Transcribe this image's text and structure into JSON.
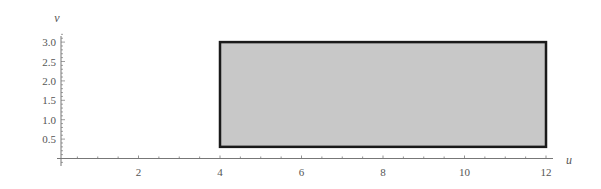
{
  "chart_data": {
    "type": "area",
    "title": "",
    "xlabel": "u",
    "ylabel": "v",
    "xlim": [
      0,
      12.5
    ],
    "ylim": [
      0,
      3.2
    ],
    "x_ticks": [
      2,
      4,
      6,
      8,
      10,
      12
    ],
    "x_tick_labels": [
      "2",
      "4",
      "6",
      "8",
      "10",
      "12"
    ],
    "y_ticks": [
      0.5,
      1.0,
      1.5,
      2.0,
      2.5,
      3.0
    ],
    "y_tick_labels": [
      "0.5",
      "1.0",
      "1.5",
      "2.0",
      "2.5",
      "3.0"
    ],
    "grid": false,
    "legend": null,
    "series": [
      {
        "name": "region",
        "shape": "rectangle",
        "u_range": [
          4,
          12
        ],
        "v_range": [
          0.3,
          3.0
        ],
        "fill": "#c8c8c8",
        "stroke": "#1a1a1a"
      }
    ]
  },
  "colors": {
    "axis": "#777777",
    "fill": "#c8c8c8",
    "border": "#1a1a1a",
    "text": "#555555"
  }
}
